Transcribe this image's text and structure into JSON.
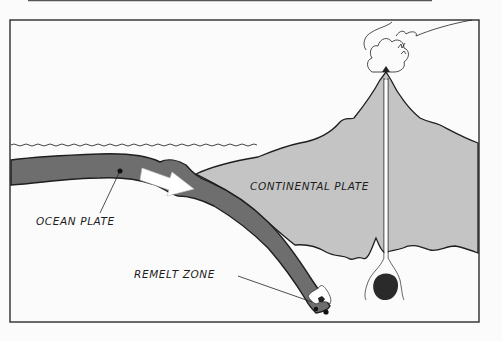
{
  "diagram": {
    "labels": {
      "ocean_plate": "OCEAN PLATE",
      "continental_plate": "CONTINENTAL PLATE",
      "remelt_zone": "REMELT ZONE"
    },
    "colors": {
      "background": "#fbfbfb",
      "frame": "#3a3a3a",
      "ocean_plate": "#6e6e6e",
      "continental_plate": "#c4c4c4",
      "outline": "#1e1e1e",
      "arrow": "#ffffff",
      "magma": "#2a2a2a"
    }
  }
}
